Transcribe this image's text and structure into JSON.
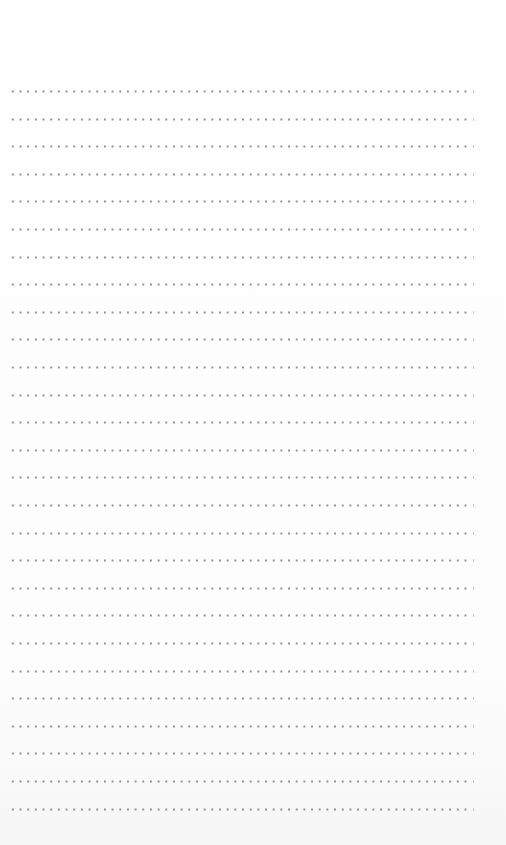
{
  "page": {
    "type": "blank dotted-rule writing page",
    "line_count": 27,
    "first_line_y": 90,
    "line_spacing": 27.6,
    "dot_color": "#8f8f8f",
    "background": "#fdfdfd"
  },
  "lines": [
    {
      "text": ""
    },
    {
      "text": ""
    },
    {
      "text": ""
    },
    {
      "text": ""
    },
    {
      "text": ""
    },
    {
      "text": ""
    },
    {
      "text": ""
    },
    {
      "text": ""
    },
    {
      "text": ""
    },
    {
      "text": ""
    },
    {
      "text": ""
    },
    {
      "text": ""
    },
    {
      "text": ""
    },
    {
      "text": ""
    },
    {
      "text": ""
    },
    {
      "text": ""
    },
    {
      "text": ""
    },
    {
      "text": ""
    },
    {
      "text": ""
    },
    {
      "text": ""
    },
    {
      "text": ""
    },
    {
      "text": ""
    },
    {
      "text": ""
    },
    {
      "text": ""
    },
    {
      "text": ""
    },
    {
      "text": ""
    },
    {
      "text": ""
    }
  ]
}
